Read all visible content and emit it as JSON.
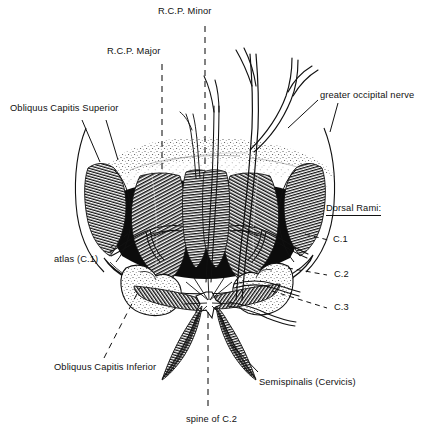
{
  "figure": {
    "background_color": "#ffffff",
    "ink_color": "#111111",
    "width": 440,
    "height": 433
  },
  "labels": {
    "rcp_minor": "R.C.P. Minor",
    "rcp_major": "R.C.P. Major",
    "obliquus_capitis_superior": "Obliquus Capitis Superior",
    "greater_occipital_nerve": "greater occipital nerve",
    "dorsal_rami_heading": "Dorsal Rami:",
    "c1": "C.1",
    "c2": "C.2",
    "c3": "C.3",
    "atlas": "atlas (C.1)",
    "obliquus_capitis_inferior": "Obliquus Capitis Inferior",
    "semispinalis_cervicis": "Semispinalis (Cervicis)",
    "spine_of_c2": "spine of C.2"
  },
  "leaders": {
    "dashed_style": "dashed",
    "solid_style": "solid"
  }
}
